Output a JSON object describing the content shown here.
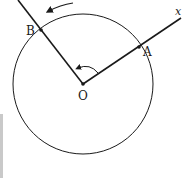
{
  "diagram": {
    "type": "geometry",
    "labels": {
      "center": "O",
      "point_a": "A",
      "point_b": "B",
      "axis": "x"
    },
    "points": [
      {
        "name": "O",
        "role": "center of circle"
      },
      {
        "name": "A",
        "role": "intersection of initial ray (x-axis) with circle"
      },
      {
        "name": "B",
        "role": "intersection of terminal ray with circle"
      }
    ],
    "rays": [
      {
        "from": "O",
        "through": "A",
        "label": "x",
        "role": "initial side"
      },
      {
        "from": "O",
        "through": "B",
        "role": "terminal side"
      }
    ],
    "rotation_direction": "counterclockwise",
    "colors": {
      "stroke": "#1a1a1a",
      "background": "#ffffff"
    }
  }
}
